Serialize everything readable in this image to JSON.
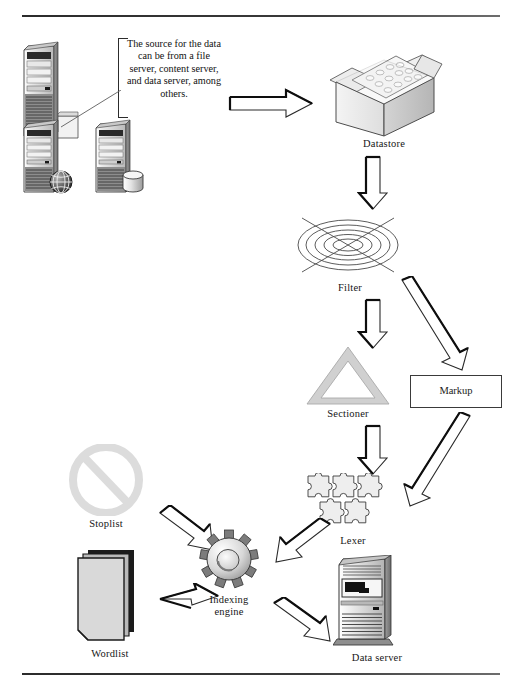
{
  "figure": {
    "background_color": "#ffffff",
    "rule_color": "#2b2b2b"
  },
  "callout": {
    "text": "The source for the data can be from a file server, content server, and data server, among others."
  },
  "nodes": [
    {
      "id": "file-server",
      "label": "",
      "icon": "server-with-document-icon"
    },
    {
      "id": "web-server",
      "label": "",
      "icon": "server-with-globe-icon"
    },
    {
      "id": "db-server",
      "label": "",
      "icon": "server-with-database-icon"
    },
    {
      "id": "datastore",
      "label": "Datastore",
      "icon": "open-box-icon"
    },
    {
      "id": "filter",
      "label": "Filter",
      "icon": "concentric-ellipse-filter-icon"
    },
    {
      "id": "sectioner",
      "label": "Sectioner",
      "icon": "triangle-outline-icon"
    },
    {
      "id": "markup",
      "label": "Markup",
      "icon": "rectangle-box-icon"
    },
    {
      "id": "lexer",
      "label": "Lexer",
      "icon": "puzzle-pieces-icon"
    },
    {
      "id": "stoplist",
      "label": "Stoplist",
      "icon": "prohibition-sign-icon"
    },
    {
      "id": "wordlist",
      "label": "Wordlist",
      "icon": "document-stack-icon"
    },
    {
      "id": "indexing-engine",
      "label_line1": "Indexing",
      "label_line2": "engine",
      "label": "Indexing engine",
      "icon": "gear-icon"
    },
    {
      "id": "data-server",
      "label": "Data server",
      "icon": "tower-server-icon"
    }
  ],
  "edges": [
    {
      "id": "servers-to-datastore",
      "from": "servers",
      "to": "datastore",
      "style": "block-arrow-right"
    },
    {
      "id": "datastore-to-filter",
      "from": "datastore",
      "to": "filter",
      "style": "block-arrow-down"
    },
    {
      "id": "filter-to-sectioner",
      "from": "filter",
      "to": "sectioner",
      "style": "block-arrow-down"
    },
    {
      "id": "filter-to-markup",
      "from": "filter",
      "to": "markup",
      "style": "block-arrow-diagonal"
    },
    {
      "id": "sectioner-to-lexer",
      "from": "sectioner",
      "to": "lexer",
      "style": "block-arrow-down"
    },
    {
      "id": "markup-to-lexer",
      "from": "markup",
      "to": "lexer",
      "style": "block-arrow-diagonal"
    },
    {
      "id": "stoplist-to-engine",
      "from": "stoplist",
      "to": "indexing-engine",
      "style": "block-arrow-diagonal"
    },
    {
      "id": "wordlist-to-engine",
      "from": "wordlist",
      "to": "indexing-engine",
      "style": "block-arrow-right"
    },
    {
      "id": "lexer-to-engine",
      "from": "lexer",
      "to": "indexing-engine",
      "style": "block-arrow-diagonal"
    },
    {
      "id": "engine-to-data-server",
      "from": "indexing-engine",
      "to": "data-server",
      "style": "block-arrow-diagonal"
    }
  ]
}
